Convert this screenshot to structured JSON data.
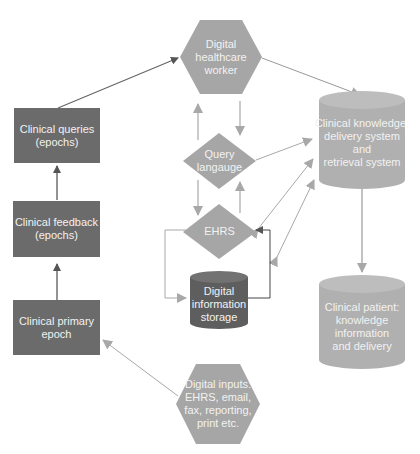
{
  "colors": {
    "dark_box": "#6b6b6b",
    "light_shape": "#a6a6a6",
    "cylinder_light": "#b0b0b0",
    "cylinder_dark": "#5e5e5e",
    "arrow_dark": "#555555",
    "arrow_light": "#a8a8a8",
    "text": "#f2f2f2"
  },
  "nodes": {
    "clinical_queries": {
      "line1": "Clinical queries",
      "line2": "(epochs)"
    },
    "clinical_feedback": {
      "line1": "Clinical feedback",
      "line2": "(epochs)"
    },
    "clinical_primary": {
      "line1": "Clinical primary",
      "line2": "epoch"
    },
    "digital_worker": {
      "line1": "Digital",
      "line2": "healthcare",
      "line3": "worker"
    },
    "query_language": {
      "line1": "Query",
      "line2": "langauge"
    },
    "ehrs": {
      "line1": "EHRS"
    },
    "digital_storage": {
      "line1": "Digital",
      "line2": "information",
      "line3": "storage"
    },
    "clinical_knowledge": {
      "line1": "Clinical knowledge;",
      "line2": "delivery system",
      "line3": "and",
      "line4": "retrieval system"
    },
    "clinical_patient": {
      "line1": "Clinical patient:",
      "line2": "knowledge",
      "line3": "information",
      "line4": "and delivery"
    },
    "digital_inputs": {
      "line1": "Digital inputs:",
      "line2": "EHRS, email,",
      "line3": "fax, reporting,",
      "line4": "print etc."
    }
  }
}
